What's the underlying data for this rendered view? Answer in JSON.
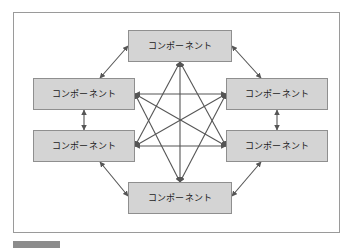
{
  "figure": {
    "kind": "diagram",
    "background_color": "#ffffff",
    "frame_border_color": "#9a9a9a",
    "box_fill_color": "#d4d4d4",
    "box_border_color": "#8f8f8f",
    "connector_color": "#555555",
    "label_color": "#1c1c1c"
  },
  "diagram": {
    "title": "",
    "node_label": "コンポーネント",
    "nodes": [
      {
        "id": "top",
        "label": "コンポーネント",
        "position": "top"
      },
      {
        "id": "left-upper",
        "label": "コンポーネント",
        "position": "left-upper"
      },
      {
        "id": "left-lower",
        "label": "コンポーネント",
        "position": "left-lower"
      },
      {
        "id": "right-upper",
        "label": "コンポーネント",
        "position": "right-upper"
      },
      {
        "id": "right-lower",
        "label": "コンポーネント",
        "position": "right-lower"
      },
      {
        "id": "bottom",
        "label": "コンポーネント",
        "position": "bottom"
      }
    ],
    "edges": [
      {
        "from": "top",
        "to": "left-upper",
        "arrows": "both"
      },
      {
        "from": "top",
        "to": "right-upper",
        "arrows": "both"
      },
      {
        "from": "top",
        "to": "left-lower",
        "arrows": "both"
      },
      {
        "from": "top",
        "to": "right-lower",
        "arrows": "both"
      },
      {
        "from": "top",
        "to": "bottom",
        "arrows": "both"
      },
      {
        "from": "left-upper",
        "to": "left-lower",
        "arrows": "both"
      },
      {
        "from": "left-upper",
        "to": "right-upper",
        "arrows": "both"
      },
      {
        "from": "left-upper",
        "to": "right-lower",
        "arrows": "both"
      },
      {
        "from": "left-upper",
        "to": "bottom",
        "arrows": "both"
      },
      {
        "from": "left-lower",
        "to": "right-upper",
        "arrows": "both"
      },
      {
        "from": "left-lower",
        "to": "right-lower",
        "arrows": "both"
      },
      {
        "from": "left-lower",
        "to": "bottom",
        "arrows": "both"
      },
      {
        "from": "right-upper",
        "to": "right-lower",
        "arrows": "both"
      },
      {
        "from": "right-upper",
        "to": "bottom",
        "arrows": "both"
      },
      {
        "from": "right-lower",
        "to": "bottom",
        "arrows": "both"
      }
    ],
    "edge_count": 15,
    "node_count": 6,
    "topology": "complete-graph"
  },
  "caption": {
    "tag_label": "",
    "text": ""
  }
}
